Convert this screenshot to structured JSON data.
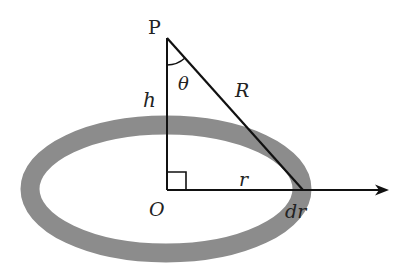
{
  "diagram": {
    "colors": {
      "background": "#ffffff",
      "ring": "#8c8c8c",
      "lines": "#111111",
      "text": "#222222"
    },
    "labels": {
      "point_p": "P",
      "height": "h",
      "angle": "θ",
      "distance": "R",
      "center": "O",
      "radius": "r",
      "ring_width": "dr"
    },
    "geometry": {
      "apex": [
        167,
        38
      ],
      "origin": [
        167,
        190
      ],
      "ring_point": [
        303,
        190
      ],
      "arrow_end": [
        388,
        190
      ],
      "ellipse_center": [
        166,
        189
      ],
      "ellipse_rx": 136,
      "ellipse_ry": 64,
      "ring_thickness": 19
    }
  }
}
